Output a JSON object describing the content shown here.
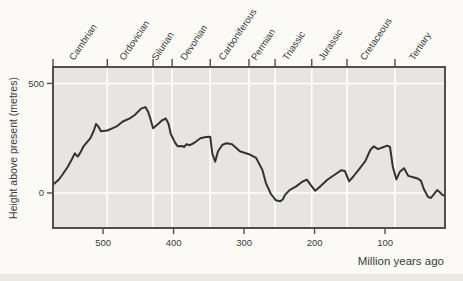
{
  "figure": {
    "kind": "textbook sea-level curve figure",
    "background": "#fbfaf7"
  },
  "chart_data": {
    "type": "line",
    "title": "",
    "xlabel": "Million years ago",
    "ylabel": "Height above present (metres)",
    "x_ticks": [
      500,
      400,
      300,
      200,
      100
    ],
    "y_ticks": [
      500,
      0
    ],
    "xlim": [
      571,
      15
    ],
    "ylim": [
      -160,
      575
    ],
    "grid": "white vertical lines at geological period boundaries, white horizontal lines at y ticks",
    "legend": "none",
    "colors": {
      "plot_bg": "#e6e5e1",
      "grid": "#ffffff",
      "frame": "#4f4f4f",
      "curve": "#333333",
      "text": "#3b3b3b"
    },
    "periods": [
      {
        "name": "Cambrian",
        "from": 571,
        "to": 494
      },
      {
        "name": "Ordovician",
        "from": 494,
        "to": 429
      },
      {
        "name": "Silurian",
        "from": 429,
        "to": 402
      },
      {
        "name": "Devonian",
        "from": 402,
        "to": 348
      },
      {
        "name": "Carboniferous",
        "from": 348,
        "to": 293
      },
      {
        "name": "Permian",
        "from": 293,
        "to": 256
      },
      {
        "name": "Triassic",
        "from": 256,
        "to": 204
      },
      {
        "name": "Jurassic",
        "from": 204,
        "to": 154
      },
      {
        "name": "Cretaceous",
        "from": 154,
        "to": 86
      },
      {
        "name": "Tertiary",
        "from": 86,
        "to": 15
      }
    ],
    "series": [
      {
        "name": "Height of sea level above present (metres)",
        "points": [
          [
            571,
            37
          ],
          [
            563,
            60
          ],
          [
            558,
            82
          ],
          [
            550,
            120
          ],
          [
            544,
            155
          ],
          [
            540,
            181
          ],
          [
            536,
            166
          ],
          [
            532,
            185
          ],
          [
            528,
            211
          ],
          [
            518,
            250
          ],
          [
            513,
            285
          ],
          [
            510,
            315
          ],
          [
            506,
            300
          ],
          [
            503,
            282
          ],
          [
            494,
            285
          ],
          [
            487,
            295
          ],
          [
            480,
            305
          ],
          [
            472,
            326
          ],
          [
            462,
            341
          ],
          [
            455,
            356
          ],
          [
            446,
            385
          ],
          [
            440,
            392
          ],
          [
            436,
            370
          ],
          [
            433,
            340
          ],
          [
            429,
            295
          ],
          [
            422,
            315
          ],
          [
            417,
            330
          ],
          [
            411,
            340
          ],
          [
            407,
            315
          ],
          [
            404,
            270
          ],
          [
            398,
            230
          ],
          [
            394,
            213
          ],
          [
            388,
            215
          ],
          [
            385,
            210
          ],
          [
            382,
            222
          ],
          [
            377,
            218
          ],
          [
            371,
            228
          ],
          [
            362,
            250
          ],
          [
            354,
            255
          ],
          [
            348,
            257
          ],
          [
            345,
            180
          ],
          [
            341,
            143
          ],
          [
            337,
            190
          ],
          [
            331,
            219
          ],
          [
            325,
            227
          ],
          [
            317,
            222
          ],
          [
            306,
            190
          ],
          [
            291,
            174
          ],
          [
            283,
            160
          ],
          [
            274,
            105
          ],
          [
            269,
            45
          ],
          [
            262,
            -5
          ],
          [
            255,
            -33
          ],
          [
            249,
            -38
          ],
          [
            245,
            -30
          ],
          [
            242,
            -9
          ],
          [
            235,
            14
          ],
          [
            226,
            30
          ],
          [
            218,
            50
          ],
          [
            211,
            61
          ],
          [
            205,
            35
          ],
          [
            199,
            10
          ],
          [
            192,
            30
          ],
          [
            182,
            60
          ],
          [
            172,
            82
          ],
          [
            162,
            104
          ],
          [
            157,
            100
          ],
          [
            151,
            53
          ],
          [
            145,
            75
          ],
          [
            137,
            108
          ],
          [
            128,
            145
          ],
          [
            121,
            196
          ],
          [
            116,
            213
          ],
          [
            110,
            200
          ],
          [
            103,
            209
          ],
          [
            97,
            216
          ],
          [
            93,
            210
          ],
          [
            89,
            120
          ],
          [
            84,
            62
          ],
          [
            79,
            97
          ],
          [
            73,
            113
          ],
          [
            67,
            78
          ],
          [
            60,
            72
          ],
          [
            53,
            65
          ],
          [
            49,
            55
          ],
          [
            45,
            18
          ],
          [
            39,
            -18
          ],
          [
            35,
            -23
          ],
          [
            30,
            -3
          ],
          [
            26,
            13
          ],
          [
            22,
            2
          ],
          [
            19,
            -8
          ],
          [
            15,
            -15
          ]
        ]
      }
    ]
  }
}
